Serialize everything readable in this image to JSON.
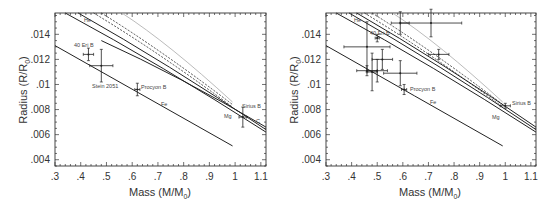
{
  "chart_data": [
    {
      "type": "scatter",
      "panel": "left",
      "xlabel": "Mass (M/M⊙)",
      "ylabel": "Radius (R/R⊙)",
      "xlim": [
        0.3,
        1.12
      ],
      "ylim": [
        0.0035,
        0.0157
      ],
      "xticks": [
        ".3",
        ".4",
        ".5",
        ".6",
        ".7",
        ".8",
        ".9",
        "1",
        "1.1"
      ],
      "yticks": [
        ".004",
        ".006",
        ".008",
        ".01",
        ".012",
        ".014"
      ],
      "grid": false,
      "curves": [
        {
          "name": "Fe",
          "style": "solid",
          "x": [
            0.3,
            0.99
          ],
          "y": [
            0.0131,
            0.0051
          ]
        },
        {
          "name": "Mg",
          "style": "solid",
          "x": [
            0.34,
            1.12
          ],
          "y": [
            0.0157,
            0.0062
          ]
        },
        {
          "name": "C",
          "style": "solid",
          "x": [
            0.39,
            1.12
          ],
          "y": [
            0.0157,
            0.0064
          ]
        },
        {
          "name": "He",
          "style": "solid",
          "x": [
            0.48,
            1.12
          ],
          "y": [
            0.0135,
            0.0066
          ]
        },
        {
          "name": "dashed-1",
          "style": "dashed",
          "x": [
            0.45,
            0.99
          ],
          "y": [
            0.0157,
            0.0082
          ]
        },
        {
          "name": "dashed-2",
          "style": "dashed",
          "x": [
            0.48,
            0.99
          ],
          "y": [
            0.0157,
            0.0084
          ]
        },
        {
          "name": "thin-grey",
          "style": "solid-light",
          "x": [
            0.56,
            0.99
          ],
          "y": [
            0.0157,
            0.0086
          ]
        }
      ],
      "points": [
        {
          "label": "40 Eri B",
          "x": 0.43,
          "y": 0.0124,
          "xerr": 0.02,
          "yerr": 0.0005
        },
        {
          "label": "Stein 2051",
          "x": 0.48,
          "y": 0.0115,
          "xerr": 0.045,
          "yerr": 0.0013
        },
        {
          "label": "Procyon B",
          "x": 0.62,
          "y": 0.0096,
          "xerr": 0.01,
          "yerr": 0.0005
        },
        {
          "label": "Sirius B",
          "x": 1.03,
          "y": 0.0074,
          "xerr": 0.015,
          "yerr": 0.0008
        }
      ],
      "annotations": [
        "He",
        "40 Eri B",
        "Stein 2051",
        "Procyon B",
        "Fe",
        "Sirius B",
        "Mg",
        "C"
      ]
    },
    {
      "type": "scatter",
      "panel": "right",
      "xlabel": "Mass (M/M⊙)",
      "ylabel": "Radius (R/R⊙)",
      "xlim": [
        0.3,
        1.12
      ],
      "ylim": [
        0.0035,
        0.0157
      ],
      "xticks": [
        ".3",
        ".4",
        ".5",
        ".6",
        ".7",
        ".8",
        ".9",
        "1",
        "1.1"
      ],
      "yticks": [
        ".004",
        ".006",
        ".008",
        ".01",
        ".012",
        ".014"
      ],
      "grid": false,
      "curves": [
        {
          "name": "Fe",
          "style": "solid",
          "x": [
            0.3,
            0.99
          ],
          "y": [
            0.0131,
            0.0051
          ]
        },
        {
          "name": "Mg",
          "style": "solid",
          "x": [
            0.34,
            1.12
          ],
          "y": [
            0.0157,
            0.0062
          ]
        },
        {
          "name": "C",
          "style": "solid",
          "x": [
            0.39,
            1.12
          ],
          "y": [
            0.0157,
            0.0064
          ]
        },
        {
          "name": "He",
          "style": "solid",
          "x": [
            0.42,
            1.12
          ],
          "y": [
            0.0157,
            0.0066
          ]
        },
        {
          "name": "dashed-1",
          "style": "dashed",
          "x": [
            0.45,
            0.99
          ],
          "y": [
            0.0157,
            0.0082
          ]
        },
        {
          "name": "dashed-2",
          "style": "dashed",
          "x": [
            0.48,
            0.99
          ],
          "y": [
            0.0157,
            0.0084
          ]
        },
        {
          "name": "thin-grey",
          "style": "solid-light",
          "x": [
            0.56,
            0.99
          ],
          "y": [
            0.0157,
            0.0086
          ]
        }
      ],
      "points": [
        {
          "label": "",
          "x": 0.59,
          "y": 0.0149,
          "xerr": 0.035,
          "yerr": 0.0009
        },
        {
          "label": "",
          "x": 0.71,
          "y": 0.0149,
          "xerr": 0.12,
          "yerr": 0.0011
        },
        {
          "label": "40 Eri B",
          "x": 0.5,
          "y": 0.0137,
          "xerr": 0.008,
          "yerr": 0.0003
        },
        {
          "label": "",
          "x": 0.46,
          "y": 0.013,
          "xerr": 0.09,
          "yerr": 0.002
        },
        {
          "label": "",
          "x": 0.74,
          "y": 0.0124,
          "xerr": 0.04,
          "yerr": 0.0004
        },
        {
          "label": "",
          "x": 0.52,
          "y": 0.012,
          "xerr": 0.04,
          "yerr": 0.0008
        },
        {
          "label": "",
          "x": 0.46,
          "y": 0.0111,
          "xerr": 0.04,
          "yerr": 0.0004
        },
        {
          "label": "",
          "x": 0.5,
          "y": 0.0111,
          "xerr": 0.04,
          "yerr": 0.0009
        },
        {
          "label": "",
          "x": 0.48,
          "y": 0.011,
          "xerr": 0.02,
          "yerr": 0.0015
        },
        {
          "label": "",
          "x": 0.59,
          "y": 0.0109,
          "xerr": 0.065,
          "yerr": 0.001
        },
        {
          "label": "Procyon B",
          "x": 0.605,
          "y": 0.0096,
          "xerr": 0.01,
          "yerr": 0.0004
        },
        {
          "label": "Sirius B",
          "x": 1.0,
          "y": 0.0083,
          "xerr": 0.02,
          "yerr": 0.0002
        }
      ],
      "annotations": [
        "He",
        "40 Eri B",
        "Procyon B",
        "Fe",
        "Sirius B",
        "Mg"
      ]
    }
  ],
  "labels": {
    "xlabel": "Mass (M/M",
    "xlabel_sub": "0",
    "xlabel_end": ")",
    "ylabel": "Radius (R/R",
    "ylabel_sub": "0",
    "ylabel_end": ")",
    "xticks": [
      ".3",
      ".4",
      ".5",
      ".6",
      ".7",
      ".8",
      ".9",
      "1",
      "1.1"
    ],
    "yticks": [
      ".004",
      ".006",
      ".008",
      ".01",
      ".012",
      ".014"
    ],
    "left": {
      "he": "He",
      "eri": "40 Eri B",
      "stein": "Stein 2051",
      "procyon": "Procyon B",
      "fe": "Fe",
      "sirius": "Sirius B",
      "mg": "Mg",
      "c": "C"
    },
    "right": {
      "he": "He",
      "eri": "40 Eri B",
      "procyon": "Procyon B",
      "fe": "Fe",
      "sirius": "Sirius B",
      "mg": "Mg"
    }
  }
}
